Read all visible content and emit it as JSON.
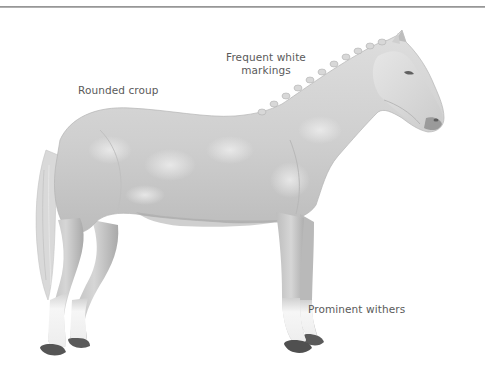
{
  "figure": {
    "colors": {
      "rule": "#8a8a8a",
      "label_text": "#5a5a5a",
      "coat_light": "#e2e2e2",
      "coat_mid": "#c9c9c9",
      "coat_dark": "#9e9e9e",
      "hoof": "#555555",
      "white_marking": "#f7f7f7"
    }
  },
  "labels": {
    "markings_line1": "Frequent white",
    "markings_line2": "markings",
    "croup": "Rounded croup",
    "withers": "Prominent withers"
  }
}
